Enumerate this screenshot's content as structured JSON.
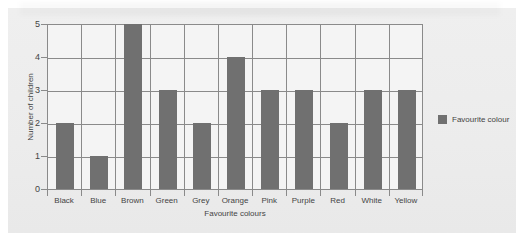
{
  "chart_data": {
    "type": "bar",
    "title": "",
    "xlabel": "Favourite colours",
    "ylabel": "Number of children",
    "categories": [
      "Black",
      "Blue",
      "Brown",
      "Green",
      "Grey",
      "Orange",
      "Pink",
      "Purple",
      "Red",
      "White",
      "Yellow"
    ],
    "series": [
      {
        "name": "Favourite colour",
        "values": [
          2,
          1,
          5,
          3,
          2,
          4,
          3,
          3,
          2,
          3,
          3
        ]
      }
    ],
    "ylim": [
      0,
      5
    ],
    "yticks": [
      "0",
      "1",
      "2",
      "3",
      "4",
      "5"
    ],
    "grid": true,
    "legend_position": "right",
    "bar_color": "#707070",
    "grid_color": "#8a8a8a"
  },
  "legend": {
    "label": "Favourite colour"
  },
  "axes": {
    "x_title": "Favourite colours",
    "y_title": "Number of children"
  }
}
